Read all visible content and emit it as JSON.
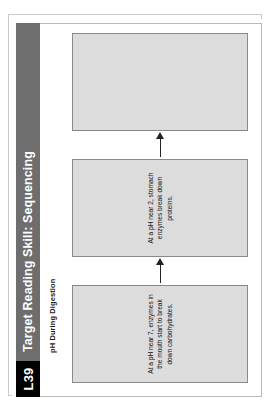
{
  "page": {
    "lesson_code": "L39",
    "header_title": "Target Reading Skill: Sequencing",
    "header_bg_color": "#6e6e6e",
    "badge_bg_color": "#000000",
    "badge_text_color": "#ffffff"
  },
  "chart": {
    "subtitle": "pH During Digestion",
    "box_fill_color": "#dcdcdc",
    "box_border_color": "#8a8a8a",
    "arrow_color": "#222222"
  },
  "flow": {
    "steps": [
      {
        "index": 1,
        "text": "At a pH near 7, enzymes in the mouth start to break down carbohydrates.",
        "filled": true
      },
      {
        "index": 2,
        "text": "At a pH near 2, stomach enzymes break down proteins.",
        "filled": true
      },
      {
        "index": 3,
        "text": "",
        "filled": false
      }
    ],
    "arrows": [
      {
        "index": 1,
        "direction": "right"
      },
      {
        "index": 2,
        "direction": "right"
      }
    ]
  }
}
